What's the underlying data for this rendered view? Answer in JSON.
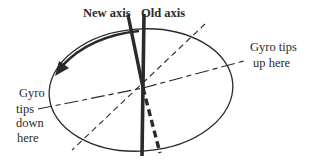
{
  "diagram": {
    "labels": {
      "new_axis": "New axis",
      "old_axis": "Old axis",
      "up_line1": "Gyro tips",
      "up_line2": "up here",
      "down_line1": "Gyro",
      "down_line2": "tips",
      "down_line3": "down",
      "down_line4": "here"
    },
    "colors": {
      "ink": "#2a2a2a",
      "background": "#ffffff"
    }
  }
}
